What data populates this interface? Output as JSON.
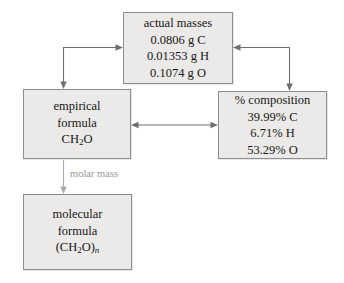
{
  "diagram": {
    "colors": {
      "box_fill": "#eceae9",
      "box_border": "#8d8d8d",
      "text": "#161616",
      "arrow": "#6f6f6f",
      "label_text": "#9a9a9a"
    },
    "nodes": [
      {
        "id": "actual-masses",
        "heading": "actual masses",
        "lines": [
          "0.0806 g C",
          "0.01353 g H",
          "0.1074 g O"
        ]
      },
      {
        "id": "empirical-formula",
        "lines": [
          "empirical",
          "formula"
        ],
        "formula_main": "CH",
        "formula_sub": "2",
        "formula_tail": "O"
      },
      {
        "id": "percent-composition",
        "heading": "% composition",
        "lines": [
          "39.99% C",
          "6.71% H",
          "53.29% O"
        ]
      },
      {
        "id": "molecular-formula",
        "lines": [
          "molecular",
          "formula"
        ],
        "formula_open": "(CH",
        "formula_sub": "2",
        "formula_close": "O)",
        "formula_n": "n"
      }
    ],
    "edges": [
      {
        "id": "empirical-to-actual",
        "from": "empirical-formula",
        "to": "actual-masses",
        "style": "double-headed"
      },
      {
        "id": "actual-to-percent",
        "from": "actual-masses",
        "to": "percent-composition",
        "style": "double-headed"
      },
      {
        "id": "empirical-percent",
        "from": "percent-composition",
        "to": "empirical-formula",
        "style": "double-headed"
      },
      {
        "id": "empirical-to-molecular",
        "from": "empirical-formula",
        "to": "molecular-formula",
        "style": "single-arrow",
        "label": "molar mass"
      }
    ]
  }
}
